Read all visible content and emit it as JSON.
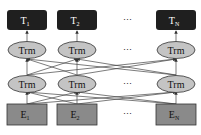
{
  "diagram": {
    "type": "transformer-encoder-stack",
    "colors": {
      "output_box": "#1f1f1f",
      "output_text": "#ffffff",
      "trm_fill": "#c4c4c4",
      "input_box": "#8a8a8a",
      "stroke": "#333333"
    },
    "outputs": [
      {
        "main": "T",
        "sub": "1"
      },
      {
        "main": "T",
        "sub": "2"
      },
      {
        "main": "T",
        "sub": "N"
      }
    ],
    "upper_layer": [
      "Trm",
      "Trm",
      "Trm"
    ],
    "lower_layer": [
      "Trm",
      "Trm",
      "Trm"
    ],
    "inputs": [
      {
        "main": "E",
        "sub": "1"
      },
      {
        "main": "E",
        "sub": "2"
      },
      {
        "main": "E",
        "sub": "N"
      }
    ],
    "ellipsis": "⋯"
  }
}
